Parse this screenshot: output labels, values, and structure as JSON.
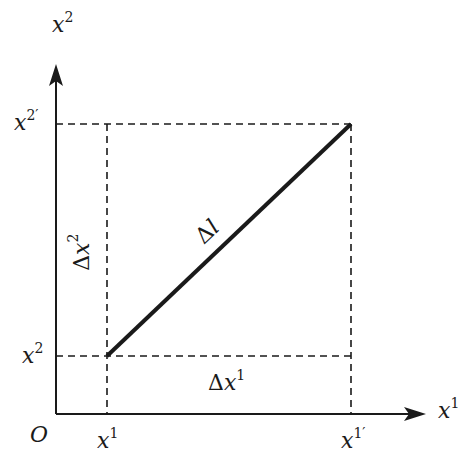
{
  "diagram": {
    "type": "coordinate-displacement",
    "colors": {
      "ink": "#1a1a1a",
      "background": "#ffffff"
    },
    "axes": {
      "origin_label": "O",
      "x_axis": {
        "base": "x",
        "sup": "1"
      },
      "y_axis": {
        "base": "x",
        "sup": "2"
      }
    },
    "ticks": {
      "x_start": {
        "base": "x",
        "sup": "1"
      },
      "x_end": {
        "base": "x",
        "sup": "1′"
      },
      "y_start": {
        "base": "x",
        "sup": "2"
      },
      "y_end": {
        "base": "x",
        "sup": "2′"
      }
    },
    "segment": {
      "delta": "Δ",
      "label": "l"
    },
    "components": {
      "dx1": {
        "delta": "Δ",
        "base": "x",
        "sup": "1"
      },
      "dx2": {
        "delta": "Δ",
        "base": "x",
        "sup": "2"
      }
    },
    "geometry": {
      "origin": [
        56,
        414
      ],
      "start": [
        107,
        356
      ],
      "end": [
        351,
        124
      ],
      "x_arrow_tip": [
        424,
        414
      ],
      "y_arrow_tip": [
        56,
        64
      ]
    }
  }
}
